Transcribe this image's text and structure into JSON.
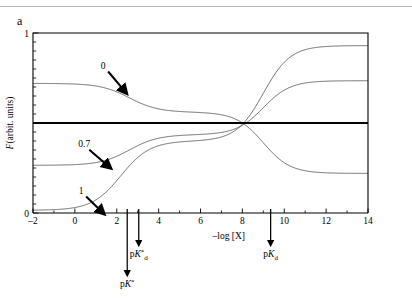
{
  "panel": {
    "label": "a"
  },
  "chart_data": {
    "type": "line",
    "title": "",
    "subtitle": "",
    "xlabel": "–log [X]",
    "ylabel": "F(arbit. units)",
    "xlim": [
      -2,
      14
    ],
    "ylim": [
      0,
      1
    ],
    "grid": false,
    "legend_position": "inline-annotations",
    "x_ticks_major": [
      -2,
      0,
      2,
      4,
      6,
      8,
      10,
      12,
      14
    ],
    "x_ticks_major_labels": [
      "–2",
      "0",
      "2",
      "4",
      "6",
      "8",
      "10",
      "12",
      "14"
    ],
    "x_ticks_minor": [
      -1,
      1,
      3,
      5,
      7,
      9,
      11,
      13
    ],
    "y_ticks_labeled": [
      0,
      1
    ],
    "y_ticks_labeled_labels": [
      "0",
      "1"
    ],
    "y_ticks_minor_count": 20,
    "reference_line": {
      "name": "isosbestic-level",
      "y": 0.5,
      "style": "thick-solid",
      "color": "#000000"
    },
    "crossing_point": {
      "x": 9.0,
      "y": 0.5,
      "name": "isosbestic-point"
    },
    "series": [
      {
        "name": "0",
        "label": "0",
        "color": "#555555",
        "left_plateau": 0.72,
        "mid_plateau": 0.56,
        "right_plateau": 0.22,
        "transitions": [
          {
            "midpoint": 2.6,
            "from": 0.72,
            "to": 0.56
          },
          {
            "midpoint": 9.0,
            "from": 0.56,
            "to": 0.22
          }
        ]
      },
      {
        "name": "0.7",
        "label": "0.7",
        "color": "#555555",
        "left_plateau": 0.265,
        "mid_plateau": 0.435,
        "right_plateau": 0.735,
        "transitions": [
          {
            "midpoint": 2.6,
            "from": 0.265,
            "to": 0.435
          },
          {
            "midpoint": 9.0,
            "from": 0.435,
            "to": 0.735
          }
        ]
      },
      {
        "name": "1",
        "label": "1",
        "color": "#555555",
        "left_plateau": 0.015,
        "mid_plateau": 0.4,
        "right_plateau": 0.93,
        "transitions": [
          {
            "midpoint": 2.2,
            "from": 0.015,
            "to": 0.4
          },
          {
            "midpoint": 9.0,
            "from": 0.4,
            "to": 0.93
          }
        ]
      }
    ],
    "curve_annotations": [
      {
        "name": "curve-label-0",
        "text": "0",
        "x": 1.35,
        "y": 0.8,
        "arrow_to_x": 2.25,
        "arrow_to_y": 0.695
      },
      {
        "name": "curve-label-0p7",
        "text": "0.7",
        "x": 0.45,
        "y": 0.365,
        "arrow_to_x": 1.45,
        "arrow_to_y": 0.275
      },
      {
        "name": "curve-label-1",
        "text": "1",
        "x": 0.3,
        "y": 0.105,
        "arrow_to_x": 1.15,
        "arrow_to_y": 0.022
      }
    ],
    "axis_arrows": [
      {
        "name": "pk-star-marker",
        "x": 2.5,
        "label_html": "p<i>K</i><sup>*</sup>",
        "label_text": "pK*",
        "depth": "long"
      },
      {
        "name": "pk-star-d-marker",
        "x": 3.05,
        "label_html": "p<i>K</i><sup>*</sup><sub>d</sub>",
        "label_text": "pK*d",
        "depth": "short"
      },
      {
        "name": "pk-d-marker",
        "x": 9.35,
        "label_html": "p<i>K</i><sub>d</sub>",
        "label_text": "pKd",
        "depth": "short"
      }
    ]
  }
}
